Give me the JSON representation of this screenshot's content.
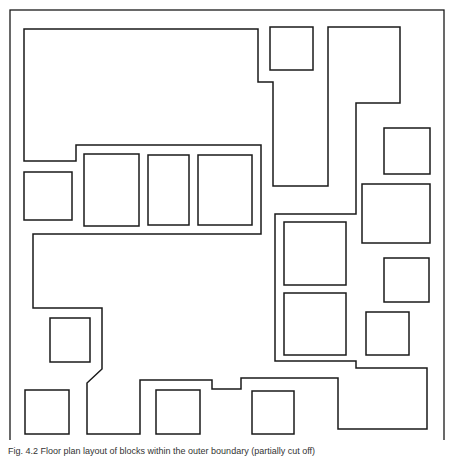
{
  "figure": {
    "stroke_color": "#1a1a1a",
    "background": "#ffffff",
    "caption": "Fig. 4.2  Floor plan layout of blocks within the outer boundary (partially cut off)",
    "outer_frame": {
      "x": 10,
      "y": 10,
      "w": 434,
      "h": 435
    },
    "main_outline": {
      "label": "routing-channel-outline",
      "points": "24,29 258,29 258,82 273,82 273,186 328,186 328,27 400,27 400,103 356,103 356,214 275,214 275,361 356,361 356,368 427,368 427,429 338,429 338,378 241,378 241,389 212,389 212,380 140,380 140,434 87,434 87,383 102,369 102,308 33,308 33,234 261,234 261,145 76,145 76,161 24,161"
    },
    "blocks": [
      {
        "name": "block-top-small",
        "x": 270,
        "y": 27,
        "w": 43,
        "h": 43
      },
      {
        "name": "block-left-small",
        "x": 24,
        "y": 172,
        "w": 48,
        "h": 48
      },
      {
        "name": "block-row-1",
        "x": 84,
        "y": 154,
        "w": 55,
        "h": 72
      },
      {
        "name": "block-row-2",
        "x": 148,
        "y": 155,
        "w": 41,
        "h": 70
      },
      {
        "name": "block-row-3",
        "x": 198,
        "y": 155,
        "w": 54,
        "h": 70
      },
      {
        "name": "block-right-1",
        "x": 384,
        "y": 128,
        "w": 46,
        "h": 46
      },
      {
        "name": "block-right-2",
        "x": 362,
        "y": 184,
        "w": 68,
        "h": 59
      },
      {
        "name": "block-center-upper",
        "x": 284,
        "y": 222,
        "w": 62,
        "h": 63
      },
      {
        "name": "block-center-lower",
        "x": 284,
        "y": 293,
        "w": 62,
        "h": 62
      },
      {
        "name": "block-right-3",
        "x": 384,
        "y": 258,
        "w": 45,
        "h": 44
      },
      {
        "name": "block-right-4",
        "x": 366,
        "y": 312,
        "w": 43,
        "h": 43
      },
      {
        "name": "block-left-mid",
        "x": 50,
        "y": 318,
        "w": 40,
        "h": 44
      },
      {
        "name": "block-bottom-1",
        "x": 25,
        "y": 390,
        "w": 44,
        "h": 44
      },
      {
        "name": "block-bottom-2",
        "x": 156,
        "y": 390,
        "w": 44,
        "h": 44
      },
      {
        "name": "block-bottom-3",
        "x": 252,
        "y": 391,
        "w": 42,
        "h": 43
      }
    ]
  }
}
